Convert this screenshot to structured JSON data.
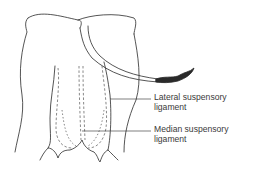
{
  "diagram": {
    "labels": [
      {
        "id": "lateral",
        "line1": "Lateral suspensory",
        "line2": "ligament"
      },
      {
        "id": "median",
        "line1": "Median suspensory",
        "line2": "ligament"
      }
    ],
    "colors": {
      "line": "#2a2a2a",
      "dashed": "#555555",
      "text": "#3a3a3a",
      "background": "#ffffff"
    }
  }
}
